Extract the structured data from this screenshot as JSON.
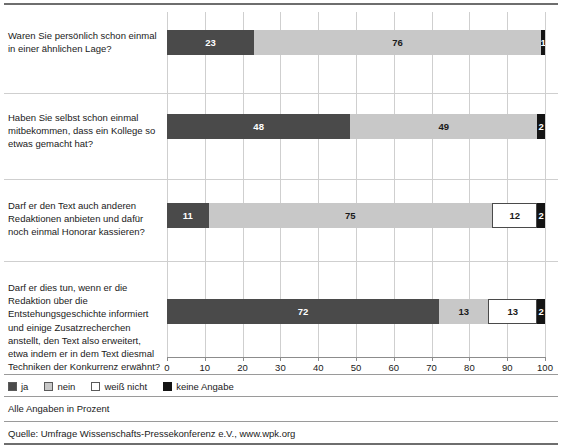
{
  "chart_data": {
    "type": "bar",
    "orientation": "horizontal",
    "stacked": true,
    "title": "",
    "xlabel": "",
    "ylabel": "",
    "xlim": [
      0,
      100
    ],
    "xticks": [
      0,
      10,
      20,
      30,
      40,
      50,
      60,
      70,
      80,
      90,
      100
    ],
    "xtick_labels": [
      "0",
      "10",
      "20",
      "30",
      "40",
      "50",
      "60",
      "70",
      "80",
      "90",
      "100"
    ],
    "grid": true,
    "legend_position": "bottom-left",
    "categories": [
      "Waren Sie persönlich schon einmal in einer ähnlichen Lage?",
      "Haben Sie selbst schon einmal mitbekommen, dass ein Kollege so etwas gemacht hat?",
      "Darf er den Text auch anderen Redaktionen anbieten und dafür noch einmal Honorar kassieren?",
      "Darf er dies tun, wenn er die Redaktion über die Entstehungsgeschichte informiert und einige Zusatzrecherchen anstellt, den Text also erweitert, etwa indem er in dem Text diesmal Techniken der Konkurrenz erwähnt?"
    ],
    "series": [
      {
        "name": "ja",
        "color": "#4a4a4a",
        "values": [
          23,
          48,
          11,
          72
        ]
      },
      {
        "name": "nein",
        "color": "#c8c8c8",
        "values": [
          76,
          49,
          75,
          13
        ]
      },
      {
        "name": "weiß nicht",
        "color": "#ffffff",
        "values": [
          0,
          0,
          12,
          13
        ]
      },
      {
        "name": "keine Angabe",
        "color": "#141414",
        "values": [
          1,
          2,
          2,
          2
        ]
      }
    ],
    "note": "Alle Angaben in Prozent",
    "source": "Quelle: Umfrage Wissenschafts-Pressekonferenz e.V., www.wpk.org"
  },
  "rows": [
    {
      "question": "Waren Sie persönlich schon einmal in einer ähnlichen Lage?",
      "segments": [
        {
          "key": "ja",
          "value": 23,
          "label": "23"
        },
        {
          "key": "nein",
          "value": 76,
          "label": "76"
        },
        {
          "key": "keine Angabe",
          "value": 1,
          "label": "1"
        }
      ]
    },
    {
      "question": "Haben Sie selbst schon einmal mitbekommen, dass ein Kollege so etwas gemacht hat?",
      "segments": [
        {
          "key": "ja",
          "value": 48,
          "label": "48"
        },
        {
          "key": "nein",
          "value": 49,
          "label": "49"
        },
        {
          "key": "keine Angabe",
          "value": 2,
          "label": "2"
        }
      ]
    },
    {
      "question": "Darf er den Text auch anderen Redaktionen anbieten und dafür noch einmal Honorar kassieren?",
      "segments": [
        {
          "key": "ja",
          "value": 11,
          "label": "11"
        },
        {
          "key": "nein",
          "value": 75,
          "label": "75"
        },
        {
          "key": "weiß nicht",
          "value": 12,
          "label": "12"
        },
        {
          "key": "keine Angabe",
          "value": 2,
          "label": "2"
        }
      ]
    },
    {
      "question": "Darf er dies tun, wenn er die Redaktion über die Entstehungsgeschichte informiert und einige Zusatzrecherchen anstellt, den Text also erweitert, etwa indem er in dem Text diesmal Techniken der Konkurrenz erwähnt?",
      "segments": [
        {
          "key": "ja",
          "value": 72,
          "label": "72"
        },
        {
          "key": "nein",
          "value": 13,
          "label": "13"
        },
        {
          "key": "weiß nicht",
          "value": 13,
          "label": "13"
        },
        {
          "key": "keine Angabe",
          "value": 2,
          "label": "2"
        }
      ]
    }
  ],
  "legend": {
    "items": [
      {
        "key": "ja",
        "label": "ja",
        "color": "#4a4a4a"
      },
      {
        "key": "nein",
        "label": "nein",
        "color": "#c8c8c8"
      },
      {
        "key": "weiß nicht",
        "label": "weiß nicht",
        "color": "#ffffff"
      },
      {
        "key": "keine Angabe",
        "label": "keine Angabe",
        "color": "#141414"
      }
    ]
  },
  "footer": {
    "note": "Alle Angaben in Prozent",
    "source": "Quelle: Umfrage Wissenschafts-Pressekonferenz e.V., www.wpk.org"
  }
}
